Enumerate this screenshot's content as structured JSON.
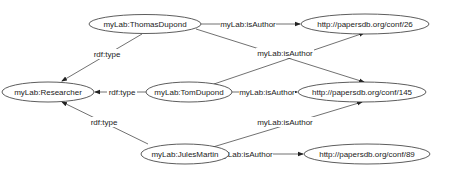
{
  "diagram": {
    "type": "rdf-graph",
    "nodes": [
      {
        "id": "thomas",
        "label": "myLab:ThomasDupond"
      },
      {
        "id": "researcher",
        "label": "myLab:Researcher"
      },
      {
        "id": "tom",
        "label": "myLab:TomDupond"
      },
      {
        "id": "jules",
        "label": "myLab:JulesMartin"
      },
      {
        "id": "conf26",
        "label": "http://papersdb.org/conf/26"
      },
      {
        "id": "conf145",
        "label": "http://papersdb.org/conf/145"
      },
      {
        "id": "conf89",
        "label": "http://papersdb.org/conf/89"
      }
    ],
    "edges": [
      {
        "from": "thomas",
        "to": "researcher",
        "label": "rdf:type"
      },
      {
        "from": "tom",
        "to": "researcher",
        "label": "rdf:type"
      },
      {
        "from": "jules",
        "to": "researcher",
        "label": "rdf:type"
      },
      {
        "from": "thomas",
        "to": "conf26",
        "label": "myLab:isAuthor"
      },
      {
        "from": "thomas",
        "to": "conf145",
        "label": "myLab:isAuthor"
      },
      {
        "from": "tom",
        "to": "conf26",
        "label": "myLab:isAuthor"
      },
      {
        "from": "tom",
        "to": "conf145",
        "label": "myLab:isAuthor"
      },
      {
        "from": "jules",
        "to": "conf145",
        "label": "myLab:isAuthor"
      },
      {
        "from": "jules",
        "to": "conf89",
        "label": "myLab:isAuthor"
      }
    ]
  }
}
